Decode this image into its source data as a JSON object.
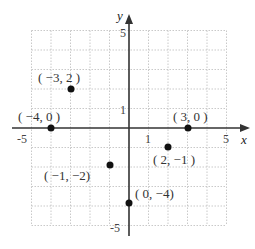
{
  "diagram": {
    "type": "coordinate-plane",
    "x_axis": {
      "label": "x",
      "range": [
        -5,
        5
      ],
      "tick_labels": [
        "-5",
        "1",
        "5"
      ]
    },
    "y_axis": {
      "label": "y",
      "range": [
        -5,
        5
      ],
      "tick_labels": [
        "5",
        "1",
        "-5"
      ]
    },
    "grid": true,
    "points": [
      {
        "x": -3,
        "y": 2,
        "label": "( −3, 2   )"
      },
      {
        "x": -4,
        "y": 0,
        "label": "( −4, 0   )"
      },
      {
        "x": 3,
        "y": 0,
        "label": "(   3, 0  )"
      },
      {
        "x": 2,
        "y": -1,
        "label": "(  2, −1 )"
      },
      {
        "x": -1,
        "y": -2,
        "label": "( −1, −2)"
      },
      {
        "x": 0,
        "y": -4,
        "label": "(   0, −4)"
      }
    ]
  }
}
